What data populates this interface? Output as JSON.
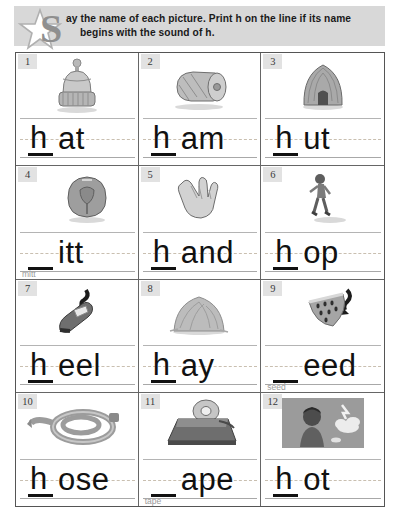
{
  "worksheet": {
    "instruction_part1": "ay the name of each picture. Print ",
    "instruction_bold1": "h",
    "instruction_part2": " on the line if its name",
    "instruction_line2_part1": "begins with the sound of ",
    "instruction_bold2": "h",
    "instruction_line2_part3": ".",
    "dropcap": "S",
    "star_icon": "star-icon",
    "header_bg": "#d8d8d8"
  },
  "items": [
    {
      "number": "1",
      "picture": "winter-hat",
      "letter": "h",
      "rest": "at",
      "hint": ""
    },
    {
      "number": "2",
      "picture": "ham",
      "letter": "h",
      "rest": "am",
      "hint": ""
    },
    {
      "number": "3",
      "picture": "hut",
      "letter": "h",
      "rest": "ut",
      "hint": ""
    },
    {
      "number": "4",
      "picture": "mitt",
      "letter": "",
      "rest": "itt",
      "hint": "mitt"
    },
    {
      "number": "5",
      "picture": "hand",
      "letter": "h",
      "rest": "and",
      "hint": ""
    },
    {
      "number": "6",
      "picture": "hop",
      "letter": "h",
      "rest": "op",
      "hint": ""
    },
    {
      "number": "7",
      "picture": "heel-shoe",
      "letter": "h",
      "rest": "eel",
      "hint": ""
    },
    {
      "number": "8",
      "picture": "hay",
      "letter": "h",
      "rest": "ay",
      "hint": ""
    },
    {
      "number": "9",
      "picture": "watermelon-seed",
      "letter": "",
      "rest": "eed",
      "hint": "seed"
    },
    {
      "number": "10",
      "picture": "hose",
      "letter": "h",
      "rest": "ose",
      "hint": ""
    },
    {
      "number": "11",
      "picture": "tape-dispenser",
      "letter": "",
      "rest": "ape",
      "hint": "tape"
    },
    {
      "number": "12",
      "picture": "hot-sun-boy",
      "letter": "h",
      "rest": "ot",
      "hint": ""
    }
  ]
}
